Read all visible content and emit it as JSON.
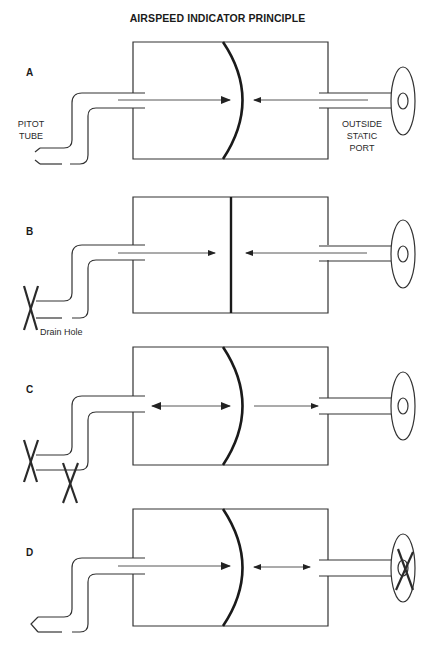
{
  "title": "AIRSPEED INDICATOR PRINCIPLE",
  "panels": [
    {
      "id": "A",
      "label": "A",
      "diaphragm": "curved-right",
      "pitot": "open",
      "static_port": "open",
      "left_arrow": "right-large",
      "right_arrow": "left"
    },
    {
      "id": "B",
      "label": "B",
      "diaphragm": "flat",
      "pitot": "blocked-inlet",
      "static_port": "open",
      "left_arrow": "right",
      "right_arrow": "left",
      "annotation": "Drain Hole"
    },
    {
      "id": "C",
      "label": "C",
      "diaphragm": "curved-right",
      "pitot": "blocked-inlet-and-drain",
      "static_port": "open",
      "left_arrow": "bidirectional",
      "right_arrow": "right"
    },
    {
      "id": "D",
      "label": "D",
      "diaphragm": "curved-right",
      "pitot": "open",
      "static_port": "blocked",
      "left_arrow": "right-large",
      "right_arrow": "bidirectional"
    }
  ],
  "labels": {
    "pitot_tube_line1": "PITOT",
    "pitot_tube_line2": "TUBE",
    "static_port_line1": "OUTSIDE",
    "static_port_line2": "STATIC",
    "static_port_line3": "PORT",
    "drain_hole": "Drain Hole"
  },
  "colors": {
    "line": "#333333",
    "background": "#ffffff"
  }
}
